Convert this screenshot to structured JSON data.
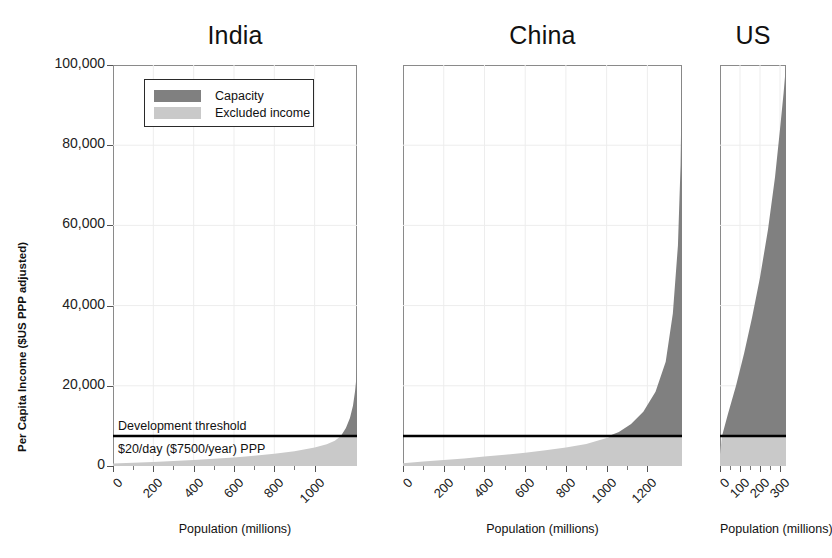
{
  "chart_data": {
    "type": "area",
    "title": "",
    "ylabel": "Per Capita Income ($US PPP adjusted)",
    "xlabel": "Population (millions)",
    "ylim": [
      0,
      100000
    ],
    "yticks": [
      0,
      20000,
      40000,
      60000,
      80000,
      100000
    ],
    "ytick_labels": [
      "0",
      "20,000",
      "40,000",
      "60,000",
      "80,000",
      "100,000"
    ],
    "grid": true,
    "legend_position": "upper-left-inside-first-panel",
    "legend": [
      {
        "label": "Capacity",
        "color": "#808080"
      },
      {
        "label": "Excluded income",
        "color": "#c9c9c9"
      }
    ],
    "threshold": {
      "value": 7500,
      "label_above": "Development threshold",
      "label_below": "$20/day ($7500/year) PPP",
      "color": "#000000"
    },
    "panels": [
      {
        "name": "India",
        "xlim": [
          0,
          1210
        ],
        "xticks": [
          0,
          200,
          400,
          600,
          800,
          1000
        ],
        "xtick_labels": [
          "0",
          "200",
          "400",
          "600",
          "800",
          "1000"
        ],
        "xlabel": "Population (millions)",
        "curve": [
          {
            "x": 0,
            "y": 600
          },
          {
            "x": 100,
            "y": 800
          },
          {
            "x": 200,
            "y": 1000
          },
          {
            "x": 300,
            "y": 1250
          },
          {
            "x": 400,
            "y": 1500
          },
          {
            "x": 500,
            "y": 1800
          },
          {
            "x": 600,
            "y": 2150
          },
          {
            "x": 700,
            "y": 2550
          },
          {
            "x": 800,
            "y": 3050
          },
          {
            "x": 900,
            "y": 3700
          },
          {
            "x": 1000,
            "y": 4600
          },
          {
            "x": 1060,
            "y": 5400
          },
          {
            "x": 1100,
            "y": 6300
          },
          {
            "x": 1130,
            "y": 7500
          },
          {
            "x": 1155,
            "y": 9500
          },
          {
            "x": 1175,
            "y": 12000
          },
          {
            "x": 1190,
            "y": 15000
          },
          {
            "x": 1200,
            "y": 18500
          },
          {
            "x": 1207,
            "y": 22000
          },
          {
            "x": 1210,
            "y": 25000
          }
        ],
        "threshold_crossing_population": 1130
      },
      {
        "name": "China",
        "xlim": [
          0,
          1370
        ],
        "xticks": [
          0,
          200,
          400,
          600,
          800,
          1000,
          1200
        ],
        "xtick_labels": [
          "0",
          "200",
          "400",
          "600",
          "800",
          "1000",
          "1200"
        ],
        "xlabel": "Population (millions)",
        "curve": [
          {
            "x": 0,
            "y": 700
          },
          {
            "x": 100,
            "y": 1100
          },
          {
            "x": 200,
            "y": 1500
          },
          {
            "x": 300,
            "y": 1900
          },
          {
            "x": 400,
            "y": 2350
          },
          {
            "x": 500,
            "y": 2800
          },
          {
            "x": 600,
            "y": 3300
          },
          {
            "x": 700,
            "y": 3900
          },
          {
            "x": 800,
            "y": 4600
          },
          {
            "x": 900,
            "y": 5500
          },
          {
            "x": 1000,
            "y": 7000
          },
          {
            "x": 1060,
            "y": 8500
          },
          {
            "x": 1120,
            "y": 10500
          },
          {
            "x": 1180,
            "y": 13500
          },
          {
            "x": 1240,
            "y": 18500
          },
          {
            "x": 1290,
            "y": 26000
          },
          {
            "x": 1325,
            "y": 38000
          },
          {
            "x": 1350,
            "y": 55000
          },
          {
            "x": 1363,
            "y": 75000
          },
          {
            "x": 1370,
            "y": 100000
          }
        ],
        "threshold_crossing_population": 1010
      },
      {
        "name": "US",
        "xlim": [
          0,
          330
        ],
        "xticks": [
          0,
          100,
          200,
          300
        ],
        "xtick_labels": [
          "0",
          "100",
          "200",
          "300"
        ],
        "xlabel": "Population (millions)",
        "curve": [
          {
            "x": 0,
            "y": 3000
          },
          {
            "x": 10,
            "y": 7500
          },
          {
            "x": 40,
            "y": 13000
          },
          {
            "x": 80,
            "y": 20000
          },
          {
            "x": 120,
            "y": 28000
          },
          {
            "x": 160,
            "y": 37000
          },
          {
            "x": 200,
            "y": 47000
          },
          {
            "x": 240,
            "y": 59000
          },
          {
            "x": 275,
            "y": 72000
          },
          {
            "x": 300,
            "y": 84000
          },
          {
            "x": 318,
            "y": 93000
          },
          {
            "x": 330,
            "y": 100000
          }
        ],
        "threshold_crossing_population": 10
      }
    ]
  }
}
